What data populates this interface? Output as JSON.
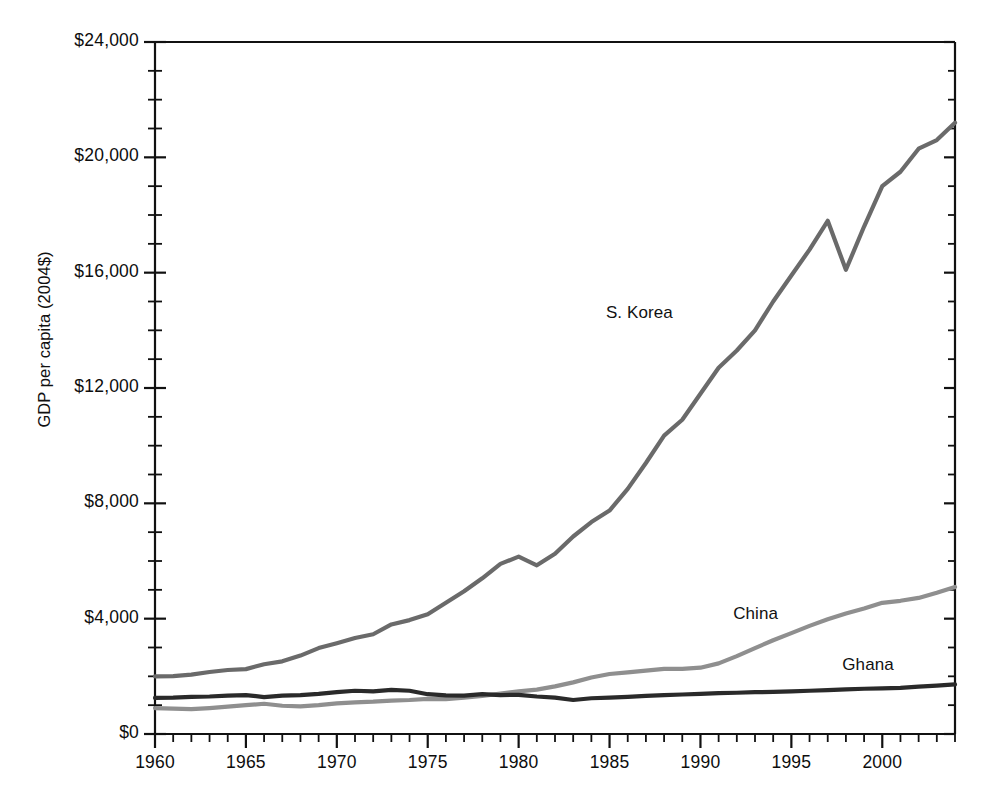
{
  "chart_data": {
    "type": "line",
    "title": "",
    "subtitle": "",
    "xlabel": "",
    "ylabel": "GDP per capita (2004$)",
    "xlim": [
      1960,
      2004
    ],
    "ylim": [
      0,
      24000
    ],
    "grid": false,
    "legend_position": "inline-annotations",
    "y_tick_labels": [
      "$0",
      "$4,000",
      "$8,000",
      "$12,000",
      "$16,000",
      "$20,000",
      "$24,000"
    ],
    "y_tick_values": [
      0,
      4000,
      8000,
      12000,
      16000,
      20000,
      24000
    ],
    "y_minor_step": 1000,
    "x_tick_labels": [
      "1960",
      "1965",
      "1970",
      "1975",
      "1980",
      "1985",
      "1990",
      "1995",
      "2000"
    ],
    "x_tick_values": [
      1960,
      1965,
      1970,
      1975,
      1980,
      1985,
      1990,
      1995,
      2000
    ],
    "x_minor_step": 1,
    "x": [
      1960,
      1961,
      1962,
      1963,
      1964,
      1965,
      1966,
      1967,
      1968,
      1969,
      1970,
      1971,
      1972,
      1973,
      1974,
      1975,
      1976,
      1977,
      1978,
      1979,
      1980,
      1981,
      1982,
      1983,
      1984,
      1985,
      1986,
      1987,
      1988,
      1989,
      1990,
      1991,
      1992,
      1993,
      1994,
      1995,
      1996,
      1997,
      1998,
      1999,
      2000,
      2001,
      2002,
      2003,
      2004
    ],
    "series": [
      {
        "name": "S. Korea",
        "color": "#6a6a6a",
        "label_x": 1987,
        "label_y": 14600,
        "values": [
          2000,
          2010,
          2060,
          2150,
          2220,
          2250,
          2420,
          2520,
          2720,
          2980,
          3150,
          3330,
          3460,
          3800,
          3950,
          4150,
          4550,
          4950,
          5400,
          5900,
          6150,
          5850,
          6250,
          6850,
          7350,
          7750,
          8500,
          9400,
          10350,
          10900,
          11800,
          12700,
          13300,
          14000,
          15000,
          15900,
          16800,
          17800,
          16100,
          17600,
          19000,
          19500,
          20300,
          20600,
          21200
        ]
      },
      {
        "name": "China",
        "color": "#8f8f8f",
        "label_x": 1994,
        "label_y": 4150,
        "values": [
          900,
          880,
          860,
          900,
          950,
          1000,
          1050,
          980,
          960,
          1000,
          1060,
          1100,
          1120,
          1160,
          1180,
          1220,
          1210,
          1260,
          1320,
          1400,
          1480,
          1540,
          1650,
          1790,
          1960,
          2080,
          2140,
          2200,
          2260,
          2260,
          2300,
          2450,
          2700,
          2980,
          3250,
          3500,
          3750,
          3980,
          4180,
          4350,
          4550,
          4620,
          4720,
          4900,
          5100
        ]
      },
      {
        "name": "Ghana",
        "color": "#2a2a2a",
        "label_x": 2000,
        "label_y": 2380,
        "values": [
          1250,
          1260,
          1290,
          1300,
          1330,
          1350,
          1280,
          1330,
          1350,
          1390,
          1450,
          1500,
          1480,
          1530,
          1500,
          1380,
          1340,
          1330,
          1380,
          1350,
          1360,
          1300,
          1260,
          1180,
          1240,
          1260,
          1290,
          1320,
          1350,
          1370,
          1390,
          1420,
          1430,
          1450,
          1460,
          1480,
          1500,
          1520,
          1550,
          1570,
          1580,
          1600,
          1640,
          1680,
          1720
        ]
      }
    ]
  },
  "axes": {
    "y_axis_title": "GDP per capita (2004$)"
  }
}
